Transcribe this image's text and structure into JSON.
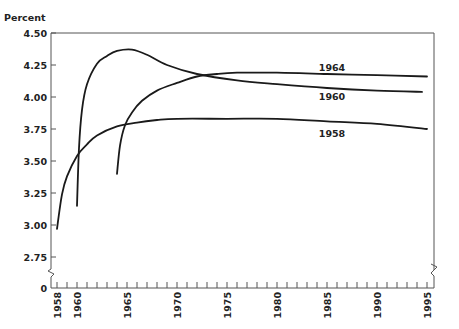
{
  "chart_data": {
    "type": "line",
    "title": "",
    "xlabel": "",
    "ylabel": "Percent",
    "xlim": [
      1958,
      1995
    ],
    "ylim": [
      2.75,
      4.5
    ],
    "y_axis_break": true,
    "y_ticks": [
      "4.50",
      "4.25",
      "4.00",
      "3.75",
      "3.50",
      "3.25",
      "3.00",
      "2.75",
      "0"
    ],
    "y_tick_values": [
      4.5,
      4.25,
      4.0,
      3.75,
      3.5,
      3.25,
      3.0,
      2.75
    ],
    "x_tick_labels": [
      "1958",
      "1960",
      "1965",
      "1970",
      "1975",
      "1980",
      "1985",
      "1990",
      "1995"
    ],
    "x_minor_ticks_every_year": true,
    "grid": false,
    "legend": "inline labels at right end of each curve",
    "series": [
      {
        "name": "1964",
        "label_position": {
          "x": 1985.5,
          "y": 4.2
        },
        "x": [
          1964.0,
          1964.3,
          1964.8,
          1965.5,
          1966.5,
          1968,
          1970,
          1972,
          1974,
          1976,
          1980,
          1985,
          1990,
          1995
        ],
        "values": [
          3.4,
          3.62,
          3.78,
          3.88,
          3.97,
          4.05,
          4.11,
          4.16,
          4.18,
          4.19,
          4.19,
          4.18,
          4.17,
          4.16
        ]
      },
      {
        "name": "1960",
        "label_position": {
          "x": 1985.5,
          "y": 3.98
        },
        "x": [
          1960.0,
          1960.2,
          1960.5,
          1961,
          1962,
          1963,
          1964,
          1965.5,
          1967,
          1969,
          1972,
          1976,
          1980,
          1985,
          1990,
          1994.5
        ],
        "values": [
          3.15,
          3.6,
          3.9,
          4.1,
          4.26,
          4.32,
          4.36,
          4.37,
          4.33,
          4.25,
          4.18,
          4.13,
          4.1,
          4.07,
          4.05,
          4.04
        ]
      },
      {
        "name": "1958",
        "label_position": {
          "x": 1985.5,
          "y": 3.69
        },
        "x": [
          1958.0,
          1958.5,
          1959,
          1960,
          1961,
          1962,
          1964,
          1966,
          1968,
          1970,
          1975,
          1980,
          1985,
          1990,
          1995
        ],
        "values": [
          2.97,
          3.24,
          3.38,
          3.54,
          3.63,
          3.7,
          3.77,
          3.8,
          3.82,
          3.83,
          3.83,
          3.83,
          3.81,
          3.79,
          3.75
        ]
      }
    ]
  }
}
